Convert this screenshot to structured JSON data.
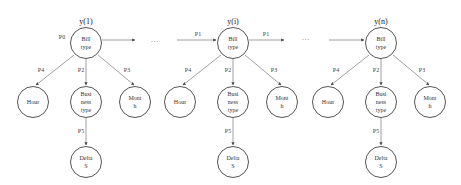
{
  "diagram": {
    "columns": [
      {
        "id": "col1",
        "title": "y(1)",
        "root": {
          "label_line1": "Bill",
          "label_line2": "type",
          "edge_in_label": "P0"
        },
        "children": [
          {
            "label_line1": "Hour",
            "label_line2": "",
            "edge_label": "P4"
          },
          {
            "label_line1": "Busi",
            "label_line2": "ness",
            "label_line3": "type",
            "edge_label": "P2"
          },
          {
            "label_line1": "Mont",
            "label_line2": "h",
            "edge_label": "P3"
          }
        ],
        "grandchild": {
          "label_line1": "Delta",
          "label_line2": "S",
          "edge_label": "P5"
        }
      },
      {
        "id": "col2",
        "title": "y(i)",
        "root": {
          "label_line1": "Bill",
          "label_line2": "type",
          "edge_in_label": "P1",
          "edge_out_label": "P1"
        },
        "children": [
          {
            "label_line1": "Hour",
            "label_line2": "",
            "edge_label": "P4"
          },
          {
            "label_line1": "Busi",
            "label_line2": "ness",
            "label_line3": "type",
            "edge_label": "P2"
          },
          {
            "label_line1": "Mont",
            "label_line2": "h",
            "edge_label": "P3"
          }
        ],
        "grandchild": {
          "label_line1": "Delta",
          "label_line2": "S",
          "edge_label": "P5"
        }
      },
      {
        "id": "col3",
        "title": "y(n)",
        "root": {
          "label_line1": "Bill",
          "label_line2": "type"
        },
        "children": [
          {
            "label_line1": "Hour",
            "label_line2": "",
            "edge_label": "P4"
          },
          {
            "label_line1": "Busi",
            "label_line2": "ness",
            "label_line3": "type",
            "edge_label": "P2"
          },
          {
            "label_line1": "Mont",
            "label_line2": "h",
            "edge_label": "P3"
          }
        ],
        "grandchild": {
          "label_line1": "Delta",
          "label_line2": "S",
          "edge_label": "P5"
        }
      }
    ],
    "ellipsis": [
      "...",
      "...",
      "...",
      "..."
    ]
  }
}
